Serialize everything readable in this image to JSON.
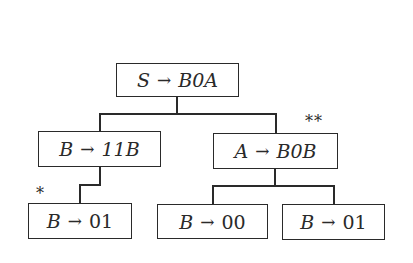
{
  "diagram": {
    "type": "derivation-tree",
    "nodes": [
      {
        "id": "root",
        "lhs": "S",
        "arrow": "→",
        "rhs_terminals_prefix": "",
        "rhs": "B0A",
        "label": "S → B0A"
      },
      {
        "id": "left",
        "lhs": "B",
        "arrow": "→",
        "rhs": "11B",
        "label": "B → 11B"
      },
      {
        "id": "right",
        "lhs": "A",
        "arrow": "→",
        "rhs": "B0B",
        "label": "A → B0B",
        "mark": "**"
      },
      {
        "id": "left-left",
        "lhs": "B",
        "arrow": "→",
        "rhs": "01",
        "label": "B → 01",
        "mark": "*"
      },
      {
        "id": "right-left",
        "lhs": "B",
        "arrow": "→",
        "rhs": "00",
        "label": "B → 00"
      },
      {
        "id": "right-right",
        "lhs": "B",
        "arrow": "→",
        "rhs": "01",
        "label": "B → 01"
      }
    ],
    "edges": [
      {
        "from": "root",
        "to": "left"
      },
      {
        "from": "root",
        "to": "right"
      },
      {
        "from": "left",
        "to": "left-left"
      },
      {
        "from": "right",
        "to": "right-left"
      },
      {
        "from": "right",
        "to": "right-right"
      }
    ],
    "marks": {
      "single": "*",
      "double": "**"
    }
  }
}
